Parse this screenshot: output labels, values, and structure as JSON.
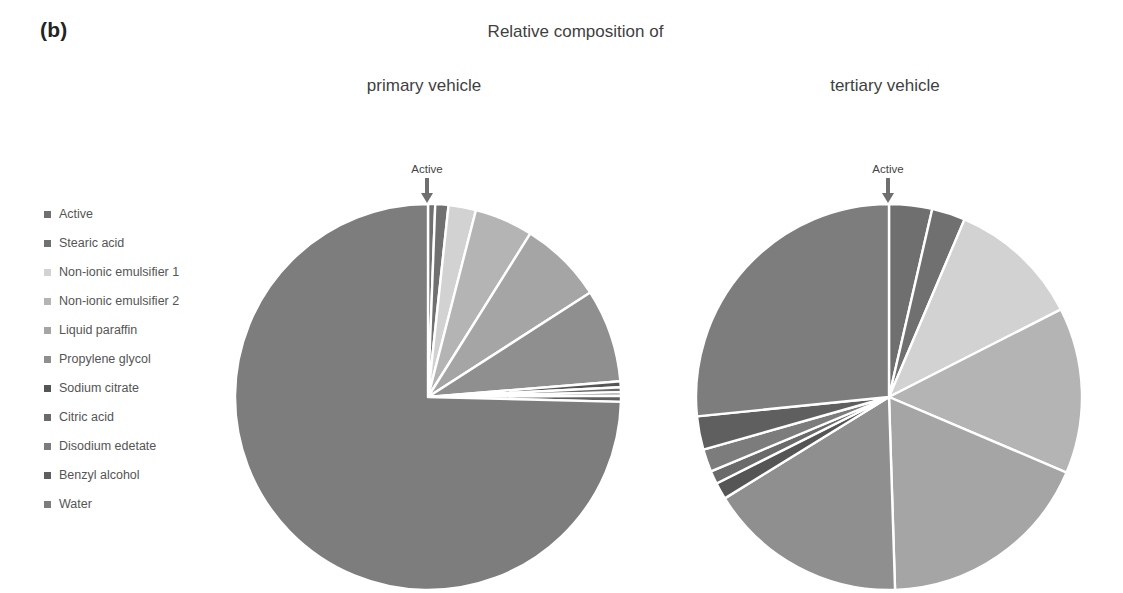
{
  "panel": {
    "label": "(b)"
  },
  "titles": {
    "main": "Relative composition of",
    "primary": "primary vehicle",
    "tertiary": "tertiary vehicle"
  },
  "callouts": {
    "primary": {
      "text": "Active",
      "icon": "down-arrow-icon"
    },
    "tertiary": {
      "text": "Active",
      "icon": "down-arrow-icon"
    }
  },
  "legend": {
    "items": [
      {
        "label": "Active",
        "color": "#6f6f6f"
      },
      {
        "label": "Stearic acid",
        "color": "#707070"
      },
      {
        "label": "Non-ionic emulsifier 1",
        "color": "#d2d2d2"
      },
      {
        "label": "Non-ionic emulsifier 2",
        "color": "#b4b4b4"
      },
      {
        "label": "Liquid paraffin",
        "color": "#a5a5a5"
      },
      {
        "label": "Propylene glycol",
        "color": "#8f8f8f"
      },
      {
        "label": "Sodium citrate",
        "color": "#555555"
      },
      {
        "label": "Citric acid",
        "color": "#6a6a6a"
      },
      {
        "label": "Disodium edetate",
        "color": "#7c7c7c"
      },
      {
        "label": "Benzyl alcohol",
        "color": "#5f5f5f"
      },
      {
        "label": "Water",
        "color": "#7d7d7d"
      }
    ]
  },
  "chart_data": [
    {
      "type": "pie",
      "title": "primary vehicle",
      "id": "primary",
      "center": [
        196,
        196
      ],
      "radius": 193,
      "start_angle": -90,
      "labels": [
        "Active",
        "Stearic acid",
        "Non-ionic emulsifier 1",
        "Non-ionic emulsifier 2",
        "Liquid paraffin",
        "Propylene glycol",
        "Sodium citrate",
        "Citric acid",
        "Disodium edetate",
        "Benzyl alcohol",
        "Water"
      ],
      "values": [
        0.6,
        1.1,
        2.3,
        4.9,
        7.0,
        7.8,
        0.5,
        0.4,
        0.3,
        0.5,
        74.6
      ],
      "colors": [
        "#6f6f6f",
        "#707070",
        "#d2d2d2",
        "#b4b4b4",
        "#a5a5a5",
        "#8f8f8f",
        "#555555",
        "#6a6a6a",
        "#7c7c7c",
        "#5f5f5f",
        "#7d7d7d"
      ],
      "annotation": "Active",
      "legend_position": "left",
      "units": "% w/w"
    },
    {
      "type": "pie",
      "title": "tertiary vehicle",
      "id": "tertiary",
      "center": [
        196,
        196
      ],
      "radius": 193,
      "start_angle": -90,
      "labels": [
        "Active",
        "Stearic acid",
        "Non-ionic emulsifier 1",
        "Non-ionic emulsifier 2",
        "Liquid paraffin",
        "Propylene glycol",
        "Sodium citrate",
        "Citric acid",
        "Disodium edetate",
        "Benzyl alcohol",
        "Water"
      ],
      "values": [
        3.6,
        2.8,
        11.1,
        13.9,
        18.1,
        16.7,
        1.4,
        1.1,
        1.9,
        2.8,
        26.6
      ],
      "colors": [
        "#6f6f6f",
        "#707070",
        "#d2d2d2",
        "#b4b4b4",
        "#a5a5a5",
        "#8f8f8f",
        "#555555",
        "#6a6a6a",
        "#7c7c7c",
        "#5f5f5f",
        "#7d7d7d"
      ],
      "annotation": "Active",
      "legend_position": "left",
      "units": "% w/w"
    }
  ]
}
